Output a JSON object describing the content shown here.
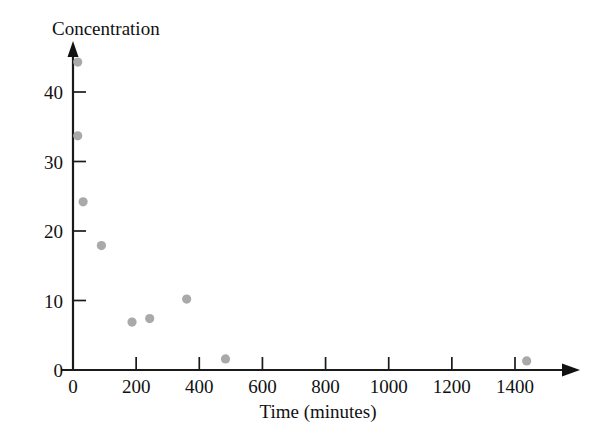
{
  "chart_data": {
    "type": "scatter",
    "title": "",
    "xlabel": "Time (minutes)",
    "ylabel": "Concentration",
    "xlim": [
      0,
      1600
    ],
    "ylim": [
      0,
      47
    ],
    "grid": false,
    "legend": null,
    "point_color": "#a9a9a9",
    "axis_color": "#111111",
    "x_ticks": [
      0,
      200,
      400,
      600,
      800,
      1000,
      1200,
      1400
    ],
    "y_ticks": [
      0,
      10,
      20,
      30,
      40
    ],
    "x_tick_labels": [
      "0",
      "200",
      "400",
      "600",
      "800",
      "1000",
      "1200",
      "1400"
    ],
    "y_tick_labels": [
      "0",
      "10",
      "20",
      "30",
      "40"
    ],
    "points": [
      {
        "x": 15,
        "y": 44.3
      },
      {
        "x": 15,
        "y": 33.7
      },
      {
        "x": 32,
        "y": 24.2
      },
      {
        "x": 90,
        "y": 17.9
      },
      {
        "x": 187,
        "y": 6.9
      },
      {
        "x": 243,
        "y": 7.4
      },
      {
        "x": 360,
        "y": 10.2
      },
      {
        "x": 483,
        "y": 1.6
      },
      {
        "x": 1437,
        "y": 1.3
      }
    ]
  },
  "axes": {
    "y_axis_label": "Concentration",
    "x_axis_label": "Time (minutes)"
  }
}
